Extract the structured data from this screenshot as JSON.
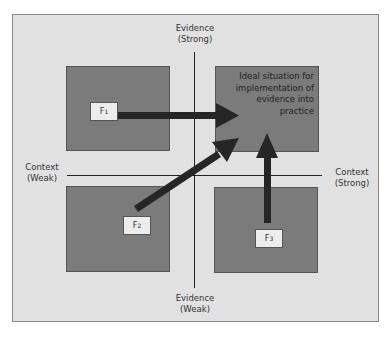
{
  "diagram": {
    "axes": {
      "evidence_top": {
        "line1": "Evidence",
        "line2": "(Strong)"
      },
      "evidence_bottom": {
        "line1": "Evidence",
        "line2": "(Weak)"
      },
      "context_left": {
        "line1": "Context",
        "line2": "(Weak)"
      },
      "context_right": {
        "line1": "Context",
        "line2": "(Strong)"
      }
    },
    "ideal_box_text": [
      "Ideal situation for",
      "implementation of",
      "evidence into",
      "practice"
    ],
    "factors": [
      {
        "id": "F1",
        "letter": "F",
        "sub": "1",
        "quadrant": "top-left",
        "arrow_to": "top-right"
      },
      {
        "id": "F2",
        "letter": "F",
        "sub": "2",
        "quadrant": "bottom-left",
        "arrow_to": "top-right"
      },
      {
        "id": "F3",
        "letter": "F",
        "sub": "3",
        "quadrant": "bottom-right",
        "arrow_to": "top-right"
      }
    ],
    "colors": {
      "background": "#e1e1e1",
      "quadrant_fill": "#7b7b7b",
      "arrow": "#262626",
      "label_box": "#ececec"
    }
  }
}
